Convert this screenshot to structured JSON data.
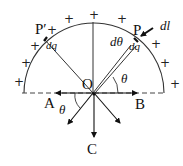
{
  "diagram": {
    "center_label": "O",
    "points": {
      "P": "P",
      "P_prime": "P′"
    },
    "element_labels": {
      "dq_right": "dq",
      "dq_left": "dq",
      "dl": "dl",
      "dtheta": "dθ",
      "theta_upper": "θ",
      "theta_lower": "θ"
    },
    "arrow_labels": {
      "A": "A",
      "B": "B",
      "C": "C"
    },
    "charge_symbol": "+",
    "charge_positions": [
      {
        "x": 14,
        "y": 76
      },
      {
        "x": 21,
        "y": 57
      },
      {
        "x": 30,
        "y": 41
      },
      {
        "x": 46,
        "y": 26
      },
      {
        "x": 64,
        "y": 14
      },
      {
        "x": 91,
        "y": 9
      },
      {
        "x": 117,
        "y": 14
      },
      {
        "x": 151,
        "y": 39
      },
      {
        "x": 160,
        "y": 57
      },
      {
        "x": 170,
        "y": 78
      }
    ]
  }
}
